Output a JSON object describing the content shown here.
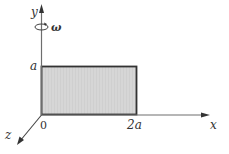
{
  "diagram": {
    "axes": {
      "x_label": "x",
      "y_label": "y",
      "z_label": "z",
      "origin_label": "0"
    },
    "rotation": {
      "symbol": "ω",
      "axis": "y"
    },
    "plate": {
      "width_label": "2a",
      "height_label": "a",
      "fill": "#d9d9d9",
      "stroke": "#333333"
    },
    "colors": {
      "axis": "#6e6e6e",
      "text": "#333333"
    }
  }
}
